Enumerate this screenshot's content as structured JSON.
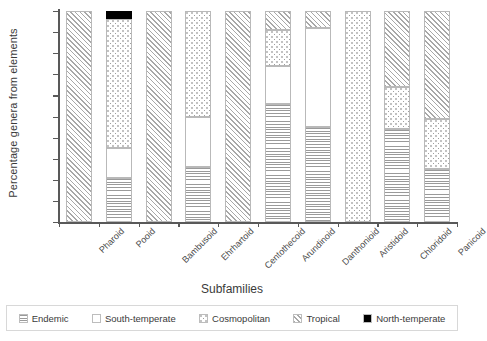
{
  "chart_data": {
    "type": "bar",
    "stacked": true,
    "title": "",
    "xlabel": "Subfamilies",
    "ylabel": "Percentage genera from elements",
    "ylim": [
      0,
      100
    ],
    "ytick_labels": [
      "0%",
      "10%",
      "20%",
      "30%",
      "40%",
      "50%",
      "60%",
      "70%",
      "80%",
      "90%",
      "100%"
    ],
    "ytick_values": [
      0,
      10,
      20,
      30,
      40,
      50,
      60,
      70,
      80,
      90,
      100
    ],
    "grid": false,
    "legend_position": "bottom",
    "categories": [
      "Pharoid",
      "Pooid",
      "Bambusoid",
      "Ehrhartoid",
      "Centothecoid",
      "Arundinoid",
      "Danthonioid",
      "Aristidoid",
      "Chloridoid",
      "Panicoid"
    ],
    "series": [
      {
        "name": "Endemic",
        "pattern": "horizontal-lines",
        "color": "#9a9a9a",
        "values": [
          0,
          21,
          0,
          26,
          0,
          56,
          45,
          0,
          44,
          25
        ]
      },
      {
        "name": "South-temperate",
        "pattern": "solid-white",
        "color": "#ffffff",
        "values": [
          0,
          14,
          0,
          24,
          0,
          18,
          47,
          0,
          0,
          0
        ]
      },
      {
        "name": "Cosmopolitan",
        "pattern": "dotted",
        "color": "#9e9e9e",
        "values": [
          0,
          61,
          0,
          50,
          0,
          17,
          0,
          100,
          20,
          24
        ]
      },
      {
        "name": "Tropical",
        "pattern": "diagonal-hatch",
        "color": "#a8a8a8",
        "values": [
          100,
          0,
          100,
          0,
          100,
          9,
          8,
          0,
          36,
          51
        ]
      },
      {
        "name": "North-temperate",
        "pattern": "solid-black",
        "color": "#000000",
        "values": [
          0,
          4,
          0,
          0,
          0,
          0,
          0,
          0,
          0,
          0
        ]
      }
    ]
  },
  "legend": {
    "items": [
      {
        "label": "Endemic"
      },
      {
        "label": "South-temperate"
      },
      {
        "label": "Cosmopolitan"
      },
      {
        "label": "Tropical"
      },
      {
        "label": "North-temperate"
      }
    ]
  }
}
